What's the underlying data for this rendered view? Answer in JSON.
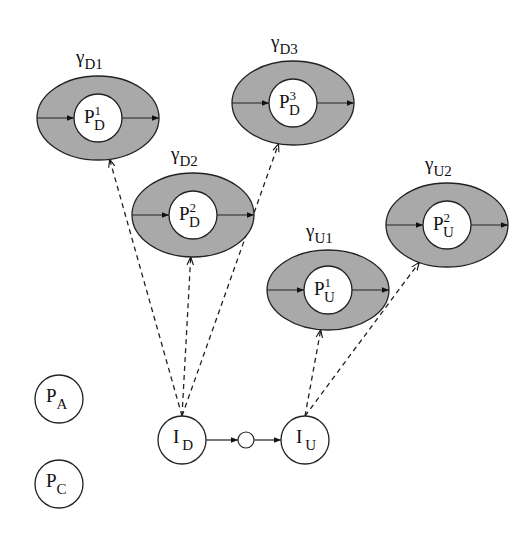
{
  "diagram": {
    "colors": {
      "background": "#ffffff",
      "ring_fill": "#a9a9a9",
      "stroke": "#222222",
      "node_fill": "#ffffff"
    },
    "regions": [
      {
        "id": "D1",
        "gamma": "γ",
        "gamma_sub": "D1",
        "node_main": "P",
        "node_sup": "1",
        "node_sub": "D",
        "cx": 98,
        "cy": 118,
        "rx": 61,
        "ry": 42
      },
      {
        "id": "D3",
        "gamma": "γ",
        "gamma_sub": "D3",
        "node_main": "P",
        "node_sup": "3",
        "node_sub": "D",
        "cx": 293,
        "cy": 103,
        "rx": 61,
        "ry": 42
      },
      {
        "id": "D2",
        "gamma": "γ",
        "gamma_sub": "D2",
        "node_main": "P",
        "node_sup": "2",
        "node_sub": "D",
        "cx": 193,
        "cy": 215,
        "rx": 61,
        "ry": 42
      },
      {
        "id": "U1",
        "gamma": "γ",
        "gamma_sub": "U1",
        "node_main": "P",
        "node_sup": "1",
        "node_sub": "U",
        "cx": 328,
        "cy": 290,
        "rx": 61,
        "ry": 40
      },
      {
        "id": "U2",
        "gamma": "γ",
        "gamma_sub": "U2",
        "node_main": "P",
        "node_sup": "2",
        "node_sub": "U",
        "cx": 447,
        "cy": 225,
        "rx": 61,
        "ry": 42
      }
    ],
    "nodes": [
      {
        "id": "PA",
        "main": "P",
        "sub": "A",
        "cx": 59,
        "cy": 399,
        "r": 24
      },
      {
        "id": "PC",
        "main": "P",
        "sub": "C",
        "cx": 59,
        "cy": 484,
        "r": 24
      },
      {
        "id": "ID",
        "main": "I",
        "sub": "D",
        "cx": 182,
        "cy": 440,
        "r": 24
      },
      {
        "id": "IU",
        "main": "I",
        "sub": "U",
        "cx": 305,
        "cy": 440,
        "r": 24
      }
    ],
    "junction": {
      "cx": 246,
      "cy": 440,
      "r": 8
    },
    "dashed_edges": [
      {
        "from": "ID",
        "to": "D1"
      },
      {
        "from": "ID",
        "to": "D2"
      },
      {
        "from": "ID",
        "to": "D3"
      },
      {
        "from": "IU",
        "to": "U1"
      },
      {
        "from": "IU",
        "to": "U2"
      }
    ],
    "solid_edges": [
      {
        "from": "ID",
        "to": "junction"
      },
      {
        "from": "junction",
        "to": "IU"
      }
    ]
  }
}
